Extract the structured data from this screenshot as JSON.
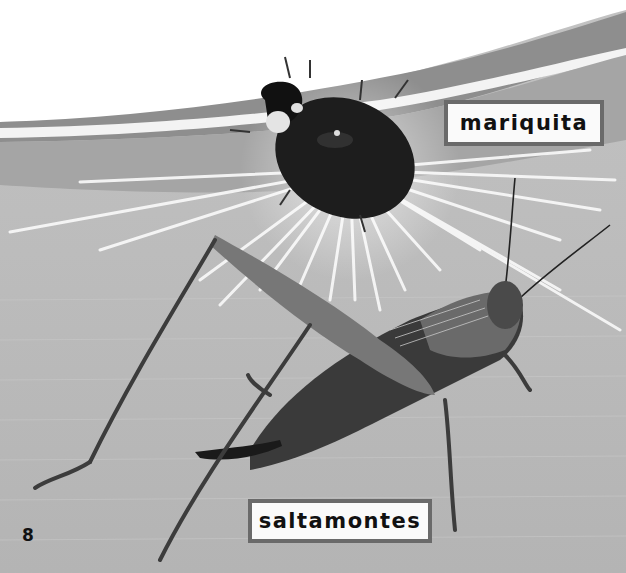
{
  "page": {
    "page_number": "8",
    "style": "grayscale picture-book page",
    "background": {
      "top_color": "#ffffff",
      "band_color": "#8c8c8c",
      "stripe_color": "#f2f2f2",
      "main_color": "#b9b9b9",
      "ray_color": "#f5f5f5"
    }
  },
  "labels": {
    "ladybug": "mariquita",
    "cricket": "saltamontes"
  },
  "images": {
    "ladybug": "ladybug-photo",
    "cricket": "cricket-photo"
  }
}
